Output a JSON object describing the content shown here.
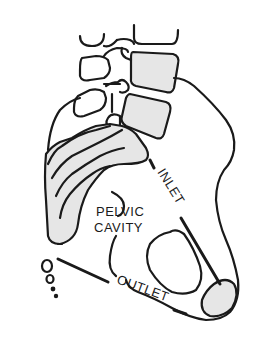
{
  "figure": {
    "type": "anatomical-diagram",
    "labels": {
      "inlet": "INLET",
      "pelvic_cavity_line1": "PELVIC",
      "pelvic_cavity_line2": "CAVITY",
      "outlet": "OUTLET"
    },
    "colors": {
      "line": "#1a1a1a",
      "bone_fill": "#e6e6e6",
      "background": "#ffffff"
    }
  }
}
